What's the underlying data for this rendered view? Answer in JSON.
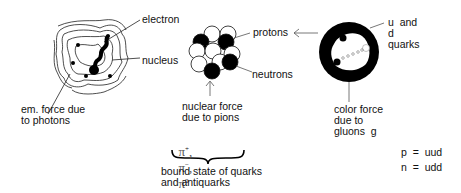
{
  "labels": {
    "electron": "electron",
    "nucleus": "nucleus",
    "em_force_line1": "em. force due",
    "em_force_line2": "to photons",
    "protons": "protons",
    "neutrons": "neutrons",
    "nuclear_force_line1": "nuclear force",
    "nuclear_force_line2": "due to pions",
    "pions": "π⁺, π⁻, π⁰",
    "bound_state_line1": "bound state of quarks",
    "bound_state_line2": "and antiquarks",
    "quarks_line1": "u  and",
    "quarks_line2": "d",
    "quarks_line3": "quarks",
    "color_force_line1": "color force",
    "color_force_line2": "due to",
    "color_force_line3": "gluons  g",
    "proton_formula": "p  =  uud",
    "neutron_formula": "n  =  udd"
  },
  "pion_parts": {
    "pi": "π",
    "plus": "+",
    "minus": "−",
    "zero": "0",
    "sep": ","
  }
}
